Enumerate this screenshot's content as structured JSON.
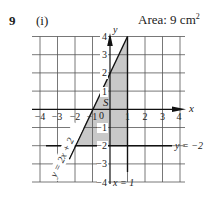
{
  "question": {
    "number": "9",
    "part": "(i)",
    "area_label": "Area: 9 cm",
    "area_unit_power": "2"
  },
  "graph": {
    "x_axis_label": "x",
    "y_axis_label": "y",
    "origin_label": "0",
    "region_label": "S",
    "x_ticks": [
      "−4",
      "−3",
      "−2",
      "−1",
      "1",
      "2",
      "3",
      "4"
    ],
    "y_ticks": [
      "4",
      "3",
      "2",
      "1",
      "−1",
      "−2",
      "−3",
      "−4"
    ],
    "lines": [
      {
        "label": "y = 2x + 2",
        "equation": "y=2x+2"
      },
      {
        "label": "y = −2",
        "equation": "y=-2"
      },
      {
        "label": "x = 1",
        "equation": "x=1"
      }
    ],
    "shaded_region": {
      "vertices": [
        [
          1,
          4
        ],
        [
          1,
          -2
        ],
        [
          -2,
          -2
        ]
      ],
      "area": 9,
      "fill": "#c8c8c8"
    },
    "grid": {
      "xmin": -4.5,
      "xmax": 4.3,
      "ymin": -4,
      "ymax": 4
    }
  }
}
